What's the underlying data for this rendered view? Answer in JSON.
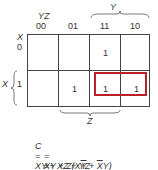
{
  "kmap": {
    "column_variables": "YZ",
    "row_variable": "X",
    "column_headers": [
      "00",
      "01",
      "11",
      "10"
    ],
    "row_headers": [
      "0",
      "1"
    ],
    "cells": [
      [
        "",
        "",
        "1",
        ""
      ],
      [
        "",
        "1",
        "1",
        "1"
      ]
    ],
    "brace_labels": {
      "top": "Y",
      "left": "X",
      "bottom": "Z"
    },
    "group_highlight_color": "#b8202a"
  },
  "equations": {
    "line1": {
      "lhs": "C",
      "eq": "=",
      "text": "XY + XZ + YZ"
    },
    "line2": {
      "eq": "=",
      "pre": "XY + Z(X",
      "bar1": "Y",
      "mid": " + ",
      "bar2": "X",
      "post": "Y)"
    },
    "line3": {
      "eq": "=",
      "text": "XY + Z(X ⊕ Y)"
    }
  }
}
